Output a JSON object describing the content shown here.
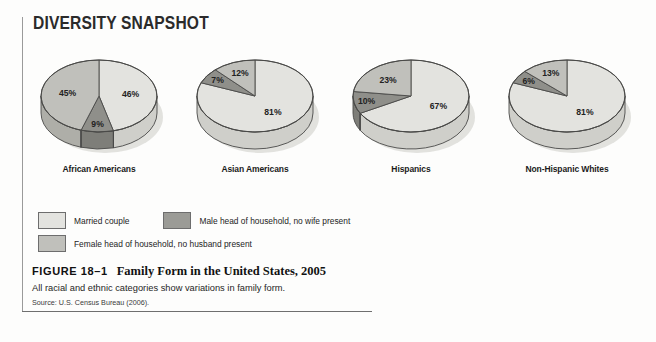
{
  "header": {
    "title": "DIVERSITY SNAPSHOT"
  },
  "colors": {
    "married": "#e3e3df",
    "married_side": "#cfcfca",
    "female": "#c0c0bb",
    "female_side": "#aeaea8",
    "male": "#8f8f8a",
    "male_side": "#7e7e79",
    "outline": "#4a4a48",
    "shadow": "#d8d8d4"
  },
  "legend": {
    "items": [
      {
        "key": "married",
        "label": "Married couple",
        "swatch": "#e3e3df"
      },
      {
        "key": "male",
        "label": "Male head of household, no wife present",
        "swatch": "#9b9b96"
      },
      {
        "key": "female",
        "label": "Female head of household, no husband present",
        "swatch": "#c0c0bb"
      }
    ]
  },
  "caption": {
    "figure_number": "FIGURE 18–1",
    "figure_title": "Family Form in the United States, 2005",
    "description": "All racial and ethnic categories show variations in family form.",
    "source": "Source: U.S. Census Bureau (2006)."
  },
  "chart_data": {
    "type": "pie",
    "title": "Family Form in the United States, 2005",
    "subtitle": "All racial and ethnic categories show variations in family form.",
    "source": "Source: U.S. Census Bureau (2006).",
    "legend_position": "below",
    "unit": "percent",
    "series_names": [
      "Married couple",
      "Male head of household, no wife present",
      "Female head of household, no husband present"
    ],
    "charts": [
      {
        "label": "African Americans",
        "slices": [
          {
            "series": "Married couple",
            "value": 46,
            "display": "46%"
          },
          {
            "series": "Male head of household, no wife present",
            "value": 9,
            "display": "9%"
          },
          {
            "series": "Female head of household, no husband present",
            "value": 45,
            "display": "45%"
          }
        ]
      },
      {
        "label": "Asian Americans",
        "slices": [
          {
            "series": "Married couple",
            "value": 81,
            "display": "81%"
          },
          {
            "series": "Male head of household, no wife present",
            "value": 7,
            "display": "7%"
          },
          {
            "series": "Female head of household, no husband present",
            "value": 12,
            "display": "12%"
          }
        ]
      },
      {
        "label": "Hispanics",
        "slices": [
          {
            "series": "Married couple",
            "value": 67,
            "display": "67%"
          },
          {
            "series": "Male head of household, no wife present",
            "value": 10,
            "display": "10%"
          },
          {
            "series": "Female head of household, no husband present",
            "value": 23,
            "display": "23%"
          }
        ]
      },
      {
        "label": "Non-Hispanic Whites",
        "slices": [
          {
            "series": "Married couple",
            "value": 81,
            "display": "81%"
          },
          {
            "series": "Male head of household, no wife present",
            "value": 6,
            "display": "6%"
          },
          {
            "series": "Female head of household, no husband present",
            "value": 13,
            "display": "13%"
          }
        ]
      }
    ]
  }
}
